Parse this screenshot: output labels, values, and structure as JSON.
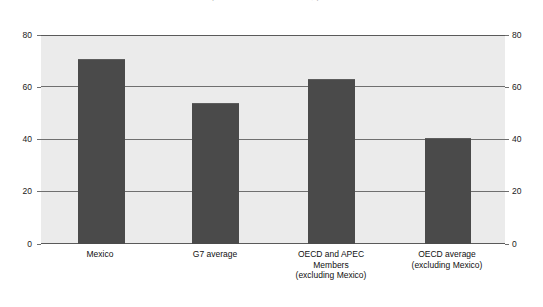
{
  "title_remnant": "Comparative indicator levels, per cent",
  "chart_data": {
    "type": "bar",
    "title": "",
    "xlabel": "",
    "ylabel": "",
    "ylim": [
      0,
      80
    ],
    "yticks": [
      0,
      20,
      40,
      60,
      80
    ],
    "ytick_labels": [
      "0",
      "20",
      "40",
      "60",
      "80"
    ],
    "right_axis": true,
    "right_ytick_labels": [
      "0",
      "20",
      "40",
      "60",
      "80"
    ],
    "grid": true,
    "legend": "none",
    "bar_color": "#4a4a4a",
    "plot_background": "#ebebeb",
    "categories": [
      "Mexico",
      "G7 average",
      "OECD and APEC\nMembers\n(excluding Mexico)",
      "OECD average\n(excluding Mexico)"
    ],
    "values": [
      71,
      54,
      63,
      40.5
    ]
  }
}
